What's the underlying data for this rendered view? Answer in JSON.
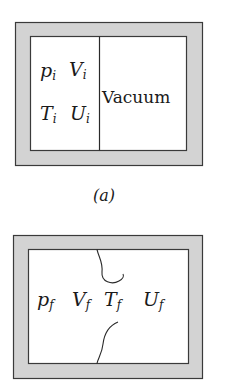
{
  "colors": {
    "wall_fill": "#d3d3d3",
    "wall_stroke": "#3a3a3a",
    "interior": "#ffffff",
    "text": "#1a1a1a"
  },
  "panel_a": {
    "caption": "(a)",
    "left_chamber": {
      "row1": [
        {
          "base": "p",
          "sub": "i"
        },
        {
          "base": "V",
          "sub": "i"
        }
      ],
      "row2": [
        {
          "base": "T",
          "sub": "i"
        },
        {
          "base": "U",
          "sub": "i"
        }
      ]
    },
    "right_chamber": {
      "label": "Vacuum"
    },
    "partition": "solid"
  },
  "panel_b": {
    "labels": [
      {
        "base": "p",
        "sub": "f"
      },
      {
        "base": "V",
        "sub": "f"
      },
      {
        "base": "T",
        "sub": "f"
      },
      {
        "base": "U",
        "sub": "f"
      }
    ],
    "partition": "ruptured"
  }
}
